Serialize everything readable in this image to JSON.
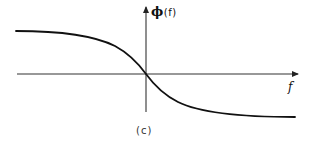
{
  "figure": {
    "caption": "(c)",
    "y_axis_label": {
      "symbol": "ϕ",
      "argument": "(f)"
    },
    "x_axis_label": "f",
    "curve_description": "Phase response decreasing monotonically from a positive plateau on the left, passing through the origin, to a negative plateau on the right",
    "colors": {
      "line": "#111111",
      "axis": "#333333",
      "background": "#ffffff"
    }
  }
}
